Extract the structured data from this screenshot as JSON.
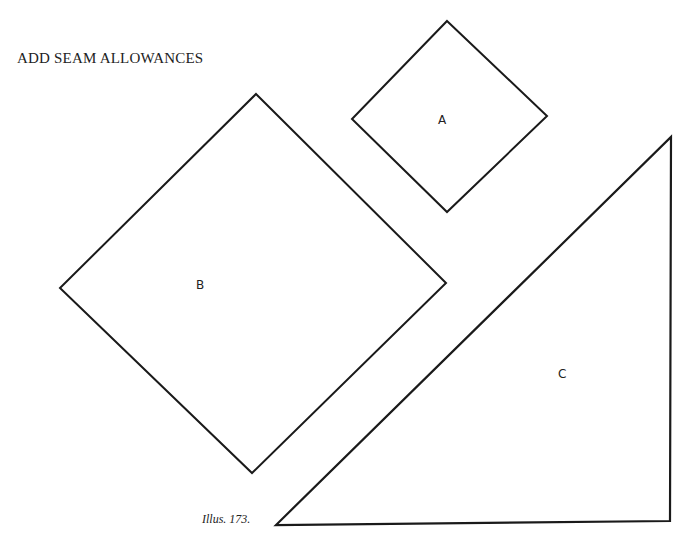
{
  "heading": "ADD SEAM ALLOWANCES",
  "caption": "Illus. 173.",
  "shapes": {
    "a": {
      "label": "A",
      "type": "square (on point)"
    },
    "b": {
      "label": "B",
      "type": "square (on point)"
    },
    "c": {
      "label": "C",
      "type": "right triangle"
    }
  },
  "colors": {
    "stroke": "#1a1a1a",
    "background": "#ffffff"
  }
}
